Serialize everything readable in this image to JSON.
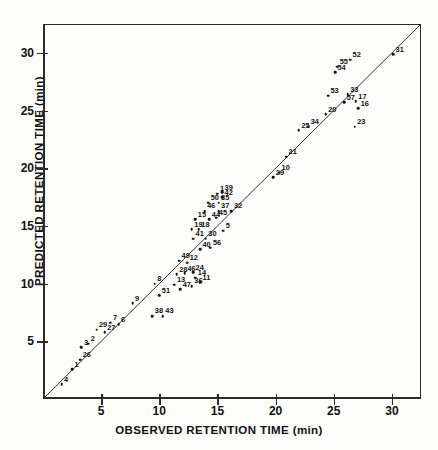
{
  "chart_data": {
    "type": "scatter",
    "title": "",
    "xlabel": "OBSERVED RETENTION TIME (min)",
    "ylabel": "PREDICTED RETENTION TIME (min)",
    "xlim": [
      0,
      32.5
    ],
    "ylim": [
      0,
      32.5
    ],
    "xticks": [
      5,
      10,
      15,
      20,
      25,
      30
    ],
    "yticks": [
      5,
      10,
      15,
      20,
      25,
      30
    ],
    "xticklabels": [
      "5",
      "10",
      "15",
      "20",
      "25",
      "30"
    ],
    "yticklabels": [
      "5",
      "10",
      "15",
      "20",
      "25",
      "30"
    ],
    "grid": false,
    "legend": false,
    "reference_line": {
      "name": "identity-line",
      "type": "line",
      "from": [
        0,
        0
      ],
      "to": [
        32.5,
        32.5
      ],
      "slope": 1,
      "intercept": 0
    },
    "point_label_field": "compound number",
    "points": [
      {
        "label": "4",
        "x": 1.6,
        "y": 1.3
      },
      {
        "label": "1",
        "x": 2.5,
        "y": 2.6
      },
      {
        "label": "26",
        "x": 3.2,
        "y": 3.4
      },
      {
        "label": "3",
        "x": 3.3,
        "y": 4.5
      },
      {
        "label": "2",
        "x": 3.9,
        "y": 4.8
      },
      {
        "label": "29",
        "x": 4.6,
        "y": 6.0
      },
      {
        "label": "27",
        "x": 5.3,
        "y": 5.8
      },
      {
        "label": "7",
        "x": 5.8,
        "y": 6.6
      },
      {
        "label": "6",
        "x": 6.5,
        "y": 6.5
      },
      {
        "label": "9",
        "x": 7.7,
        "y": 8.3
      },
      {
        "label": "38",
        "x": 9.4,
        "y": 7.2
      },
      {
        "label": "43",
        "x": 10.3,
        "y": 7.2
      },
      {
        "label": "51",
        "x": 10.0,
        "y": 9.0
      },
      {
        "label": "8",
        "x": 9.6,
        "y": 10.0
      },
      {
        "label": "13",
        "x": 11.3,
        "y": 9.9
      },
      {
        "label": "47",
        "x": 11.8,
        "y": 9.5
      },
      {
        "label": "28",
        "x": 11.5,
        "y": 10.8
      },
      {
        "label": "46",
        "x": 12.2,
        "y": 10.9
      },
      {
        "label": "24",
        "x": 12.9,
        "y": 11.0
      },
      {
        "label": "14",
        "x": 13.1,
        "y": 10.5
      },
      {
        "label": "36",
        "x": 12.8,
        "y": 9.8
      },
      {
        "label": "11",
        "x": 13.5,
        "y": 10.1
      },
      {
        "label": "49",
        "x": 11.7,
        "y": 12.0
      },
      {
        "label": "12",
        "x": 12.4,
        "y": 11.8
      },
      {
        "label": "40",
        "x": 13.5,
        "y": 13.0
      },
      {
        "label": "56",
        "x": 14.4,
        "y": 13.1
      },
      {
        "label": "41",
        "x": 12.9,
        "y": 13.9
      },
      {
        "label": "30",
        "x": 14.0,
        "y": 13.9
      },
      {
        "label": "19",
        "x": 12.8,
        "y": 14.7
      },
      {
        "label": "18",
        "x": 13.4,
        "y": 14.7
      },
      {
        "label": "5",
        "x": 15.5,
        "y": 14.6
      },
      {
        "label": "15",
        "x": 13.1,
        "y": 15.6
      },
      {
        "label": "44",
        "x": 14.3,
        "y": 15.6
      },
      {
        "label": "45",
        "x": 14.9,
        "y": 15.7
      },
      {
        "label": "46b",
        "x": 13.9,
        "y": 16.3
      },
      {
        "label": "37",
        "x": 15.1,
        "y": 16.3
      },
      {
        "label": "32",
        "x": 16.2,
        "y": 16.3
      },
      {
        "label": "50",
        "x": 14.2,
        "y": 17.0
      },
      {
        "label": "35",
        "x": 15.1,
        "y": 17.0
      },
      {
        "label": "1b",
        "x": 15.0,
        "y": 17.8
      },
      {
        "label": "39",
        "x": 15.4,
        "y": 17.9
      },
      {
        "label": "42",
        "x": 15.4,
        "y": 17.5
      },
      {
        "label": "29b",
        "x": 19.8,
        "y": 19.2
      },
      {
        "label": "10",
        "x": 20.3,
        "y": 19.6
      },
      {
        "label": "21",
        "x": 20.9,
        "y": 21.0
      },
      {
        "label": "25",
        "x": 22.0,
        "y": 23.3
      },
      {
        "label": "34",
        "x": 22.8,
        "y": 23.6
      },
      {
        "label": "20",
        "x": 24.3,
        "y": 24.7
      },
      {
        "label": "23",
        "x": 26.8,
        "y": 23.6
      },
      {
        "label": "53",
        "x": 24.5,
        "y": 26.3
      },
      {
        "label": "33",
        "x": 26.2,
        "y": 26.4
      },
      {
        "label": "57",
        "x": 25.9,
        "y": 25.7
      },
      {
        "label": "17",
        "x": 26.9,
        "y": 25.8
      },
      {
        "label": "16",
        "x": 27.1,
        "y": 25.2
      },
      {
        "label": "54",
        "x": 25.1,
        "y": 28.3
      },
      {
        "label": "55",
        "x": 25.3,
        "y": 28.8
      },
      {
        "label": "52",
        "x": 26.4,
        "y": 29.4
      },
      {
        "label": "31",
        "x": 30.1,
        "y": 29.9
      }
    ]
  },
  "axes": {
    "x_title": "OBSERVED RETENTION TIME (min)",
    "y_title": "PREDICTED RETENTION TIME (min)"
  }
}
